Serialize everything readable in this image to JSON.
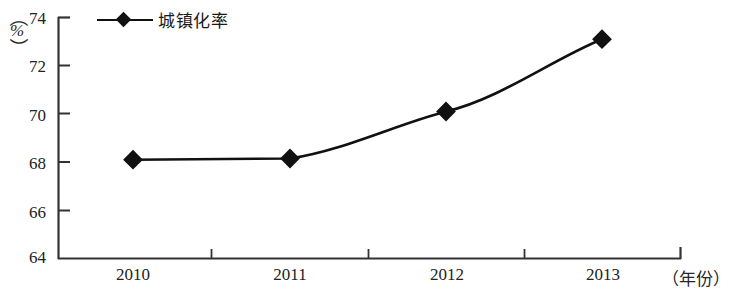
{
  "chart_data": {
    "type": "line",
    "title": "",
    "subtitle": "",
    "xlabel": "（年份）",
    "ylabel": "（%）",
    "categories": [
      "2010",
      "2011",
      "2012",
      "2013"
    ],
    "series": [
      {
        "name": "城镇化率",
        "values": [
          68.1,
          68.15,
          70.1,
          73.1
        ],
        "marker": "diamond",
        "color": "#111111"
      }
    ],
    "ylim": [
      64,
      74
    ],
    "yticks": [
      64,
      66,
      68,
      70,
      72,
      74
    ],
    "ytick_labels": [
      "64",
      "66",
      "68",
      "70",
      "72",
      "74"
    ],
    "xtick_labels": [
      "2010",
      "2011",
      "2012",
      "2013"
    ],
    "grid": false,
    "legend": {
      "position": "top-left",
      "entries": [
        "城镇化率"
      ]
    },
    "axis_color": "#333333",
    "background": "#ffffff"
  },
  "axes": {
    "y_unit_paren_open": "（",
    "y_unit_paren_close": "）",
    "y_unit_symbol": "%",
    "x_unit": "（年份）"
  },
  "legend": {
    "label": "城镇化率"
  },
  "yticks": {
    "t0": "64",
    "t1": "66",
    "t2": "68",
    "t3": "70",
    "t4": "72",
    "t5": "74"
  },
  "xticks": {
    "t0": "2010",
    "t1": "2011",
    "t2": "2012",
    "t3": "2013"
  }
}
